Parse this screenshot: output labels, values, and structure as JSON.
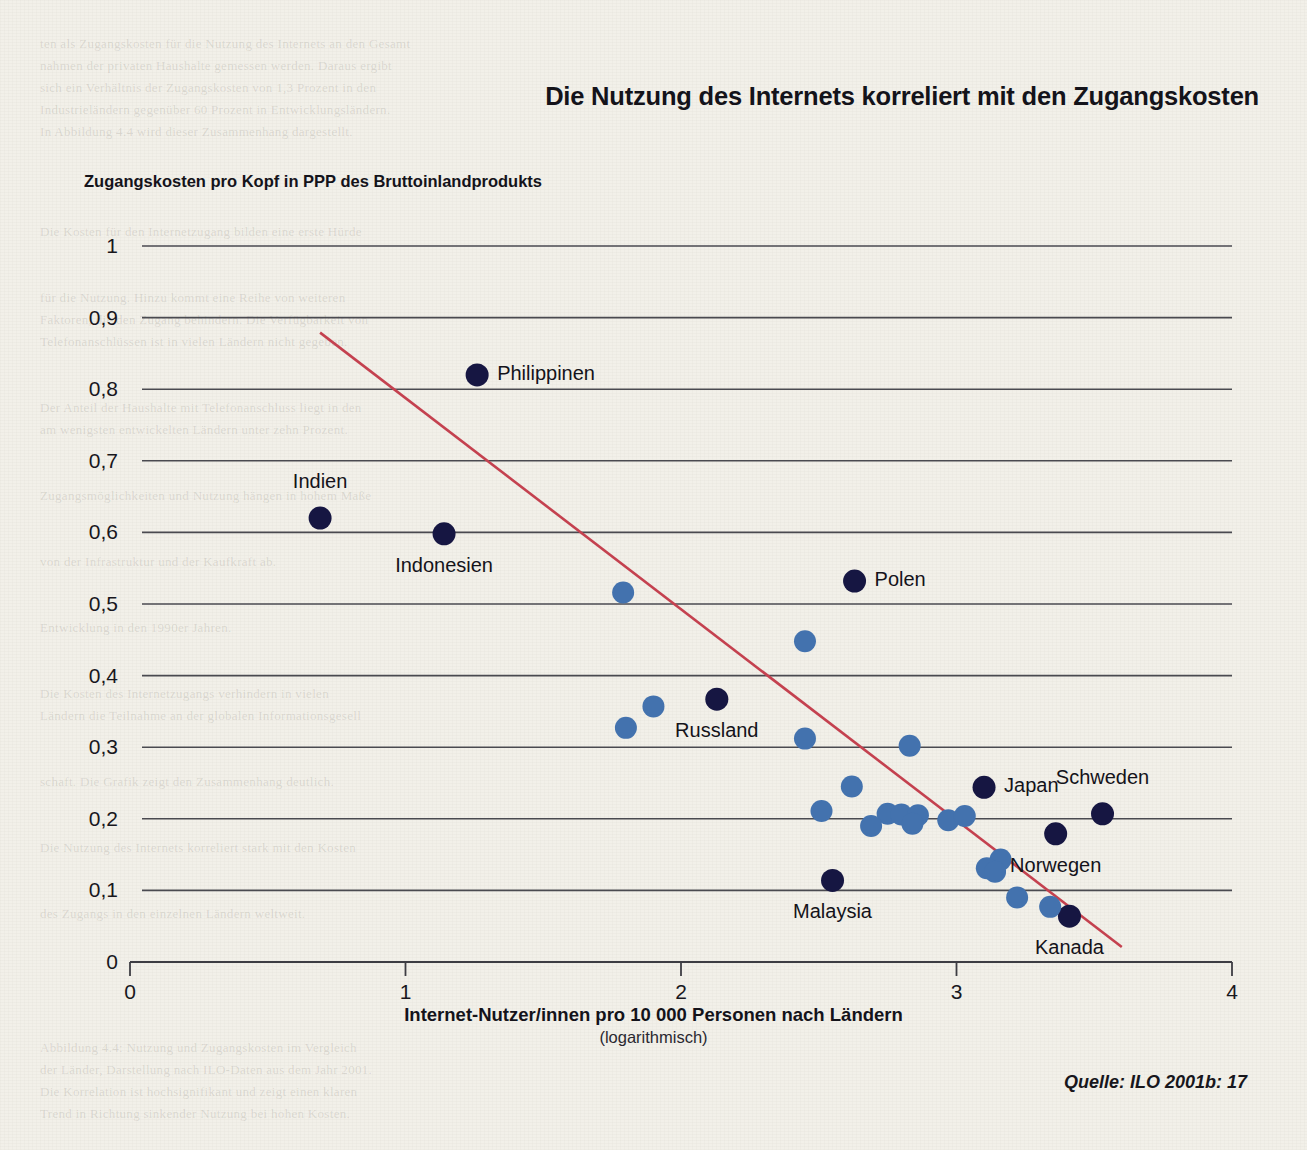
{
  "chart_data": {
    "type": "scatter",
    "title": "Die Nutzung des Internets korreliert mit den Zugangskosten",
    "ylabel": "Zugangskosten pro Kopf in PPP des Bruttoinlandprodukts",
    "xlabel": "Internet-Nutzer/innen pro 10 000 Personen nach Ländern",
    "xlabel_sub": "(logarithmisch)",
    "source": "Quelle: ILO 2001b: 17",
    "xlim": [
      0,
      4
    ],
    "ylim": [
      0,
      1
    ],
    "xticks": [
      "0",
      "1",
      "2",
      "3",
      "4"
    ],
    "xtick_values": [
      0,
      1,
      2,
      3,
      4
    ],
    "yticks": [
      "0",
      "0,1",
      "0,2",
      "0,3",
      "0,4",
      "0,5",
      "0,6",
      "0,7",
      "0,8",
      "0,9",
      "1"
    ],
    "ytick_values": [
      0,
      0.1,
      0.2,
      0.3,
      0.4,
      0.5,
      0.6,
      0.7,
      0.8,
      0.9,
      1.0
    ],
    "grid": "horizontal",
    "legend": "none",
    "colors": {
      "highlight_marker": "#161642",
      "plain_marker": "#4372AE",
      "trendline": "#C4414F",
      "gridline": "#4a4a50",
      "background": "#f2f0e9"
    },
    "trendline": {
      "x0": 0.69,
      "y0": 0.879,
      "x1": 3.6,
      "y1": 0.021
    },
    "points": [
      {
        "label": "Philippinen",
        "x": 1.26,
        "y": 0.82,
        "highlight": true,
        "label_pos": "right"
      },
      {
        "label": "Indien",
        "x": 0.69,
        "y": 0.62,
        "highlight": true,
        "label_pos": "above"
      },
      {
        "label": "Indonesien",
        "x": 1.14,
        "y": 0.598,
        "highlight": true,
        "label_pos": "below"
      },
      {
        "label": "Polen",
        "x": 2.63,
        "y": 0.532,
        "highlight": true,
        "label_pos": "right"
      },
      {
        "label": "Russland",
        "x": 2.13,
        "y": 0.367,
        "highlight": true,
        "label_pos": "below"
      },
      {
        "label": "Japan",
        "x": 3.1,
        "y": 0.244,
        "highlight": true,
        "label_pos": "right"
      },
      {
        "label": "Schweden",
        "x": 3.53,
        "y": 0.207,
        "highlight": true,
        "label_pos": "above"
      },
      {
        "label": "Norwegen",
        "x": 3.36,
        "y": 0.179,
        "highlight": true,
        "label_pos": "below"
      },
      {
        "label": "Malaysia",
        "x": 2.55,
        "y": 0.114,
        "highlight": true,
        "label_pos": "below"
      },
      {
        "label": "Kanada",
        "x": 3.41,
        "y": 0.064,
        "highlight": true,
        "label_pos": "below"
      },
      {
        "label": "",
        "x": 1.79,
        "y": 0.516,
        "highlight": false
      },
      {
        "label": "",
        "x": 2.45,
        "y": 0.448,
        "highlight": false
      },
      {
        "label": "",
        "x": 1.9,
        "y": 0.357,
        "highlight": false
      },
      {
        "label": "",
        "x": 1.8,
        "y": 0.327,
        "highlight": false
      },
      {
        "label": "",
        "x": 2.45,
        "y": 0.312,
        "highlight": false
      },
      {
        "label": "",
        "x": 2.83,
        "y": 0.302,
        "highlight": false
      },
      {
        "label": "",
        "x": 2.62,
        "y": 0.245,
        "highlight": false
      },
      {
        "label": "",
        "x": 2.51,
        "y": 0.211,
        "highlight": false
      },
      {
        "label": "",
        "x": 2.75,
        "y": 0.207,
        "highlight": false
      },
      {
        "label": "",
        "x": 2.8,
        "y": 0.206,
        "highlight": false
      },
      {
        "label": "",
        "x": 2.86,
        "y": 0.205,
        "highlight": false
      },
      {
        "label": "",
        "x": 2.69,
        "y": 0.19,
        "highlight": false
      },
      {
        "label": "",
        "x": 2.84,
        "y": 0.193,
        "highlight": false
      },
      {
        "label": "",
        "x": 2.97,
        "y": 0.198,
        "highlight": false
      },
      {
        "label": "",
        "x": 3.03,
        "y": 0.204,
        "highlight": false
      },
      {
        "label": "",
        "x": 3.16,
        "y": 0.143,
        "highlight": false
      },
      {
        "label": "",
        "x": 3.11,
        "y": 0.131,
        "highlight": false
      },
      {
        "label": "",
        "x": 3.14,
        "y": 0.126,
        "highlight": false
      },
      {
        "label": "",
        "x": 3.22,
        "y": 0.09,
        "highlight": false
      },
      {
        "label": "",
        "x": 3.34,
        "y": 0.077,
        "highlight": false
      }
    ]
  },
  "ghost_lines": [
    {
      "x": 40,
      "y": 36,
      "t": "ten als Zugangskosten für die Nutzung des Internets an den Gesamt"
    },
    {
      "x": 40,
      "y": 58,
      "t": "nahmen der privaten Haushalte gemessen werden. Daraus ergibt"
    },
    {
      "x": 40,
      "y": 80,
      "t": "sich ein Verhältnis der Zugangskosten von 1,3 Prozent in den"
    },
    {
      "x": 40,
      "y": 102,
      "t": "Industrieländern gegenüber 60 Prozent in Entwicklungsländern."
    },
    {
      "x": 40,
      "y": 124,
      "t": "In Abbildung 4.4 wird dieser Zusammenhang dargestellt."
    },
    {
      "x": 40,
      "y": 224,
      "t": "Die Kosten für den Internetzugang bilden eine erste Hürde"
    },
    {
      "x": 40,
      "y": 290,
      "t": "für die Nutzung. Hinzu kommt eine Reihe von weiteren"
    },
    {
      "x": 40,
      "y": 312,
      "t": "Faktoren, die den Zugang behindern. Die Verfügbarkeit von"
    },
    {
      "x": 40,
      "y": 334,
      "t": "Telefonanschlüssen ist in vielen Ländern nicht gegeben."
    },
    {
      "x": 40,
      "y": 400,
      "t": "Der Anteil der Haushalte mit Telefonanschluss liegt in den"
    },
    {
      "x": 40,
      "y": 422,
      "t": "am wenigsten entwickelten Ländern unter zehn Prozent."
    },
    {
      "x": 40,
      "y": 488,
      "t": "Zugangsmöglichkeiten und Nutzung hängen in hohem Maße"
    },
    {
      "x": 40,
      "y": 554,
      "t": "von der Infrastruktur und der Kaufkraft ab."
    },
    {
      "x": 40,
      "y": 620,
      "t": "Entwicklung in den 1990er Jahren."
    },
    {
      "x": 40,
      "y": 686,
      "t": "Die Kosten des Internetzugangs verhindern in vielen"
    },
    {
      "x": 40,
      "y": 708,
      "t": "Ländern die Teilnahme an der globalen Informationsgesell"
    },
    {
      "x": 40,
      "y": 774,
      "t": "schaft. Die Grafik zeigt den Zusammenhang deutlich."
    },
    {
      "x": 40,
      "y": 840,
      "t": "Die Nutzung des Internets korreliert stark mit den Kosten"
    },
    {
      "x": 40,
      "y": 906,
      "t": "des Zugangs in den einzelnen Ländern weltweit."
    },
    {
      "x": 40,
      "y": 1040,
      "t": "Abbildung 4.4: Nutzung und Zugangskosten im Vergleich"
    },
    {
      "x": 40,
      "y": 1062,
      "t": "der Länder, Darstellung nach ILO-Daten aus dem Jahr 2001."
    },
    {
      "x": 40,
      "y": 1084,
      "t": "Die Korrelation ist hochsignifikant und zeigt einen klaren"
    },
    {
      "x": 40,
      "y": 1106,
      "t": "Trend in Richtung sinkender Nutzung bei hohen Kosten."
    }
  ]
}
